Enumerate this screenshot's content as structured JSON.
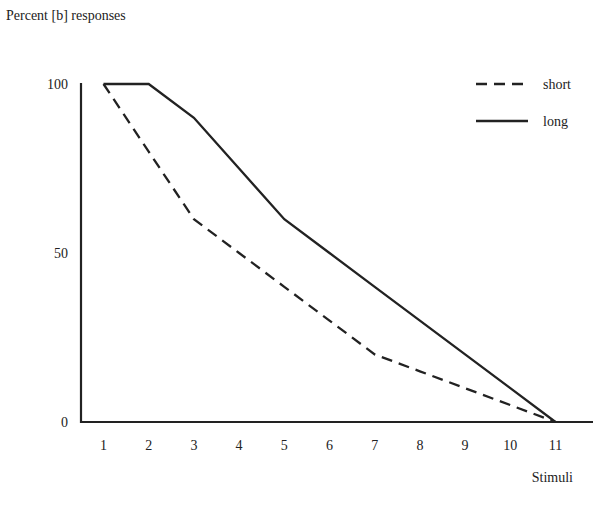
{
  "chart_data": {
    "type": "line",
    "title": "",
    "ylabel": "Percent [b] responses",
    "xlabel": "Stimuli",
    "x": [
      1,
      2,
      3,
      4,
      5,
      6,
      7,
      8,
      9,
      10,
      11
    ],
    "xticks": [
      "1",
      "2",
      "3",
      "4",
      "5",
      "6",
      "7",
      "8",
      "9",
      "10",
      "11"
    ],
    "yticks": [
      "0",
      "50",
      "100"
    ],
    "ylim": [
      0,
      100
    ],
    "xlim": [
      0.5,
      11.8
    ],
    "grid": false,
    "legend_position": "top-right",
    "series": [
      {
        "name": "short",
        "style": "dashed",
        "values": [
          100,
          80,
          60,
          50,
          40,
          30,
          20,
          15,
          10,
          5,
          0
        ]
      },
      {
        "name": "long",
        "style": "solid",
        "values": [
          100,
          100,
          90,
          75,
          60,
          50,
          40,
          30,
          20,
          10,
          0
        ]
      }
    ]
  },
  "labels": {
    "ylabel": "Percent [b] responses",
    "xlabel": "Stimuli",
    "legend_short": "short",
    "legend_long": "long"
  }
}
